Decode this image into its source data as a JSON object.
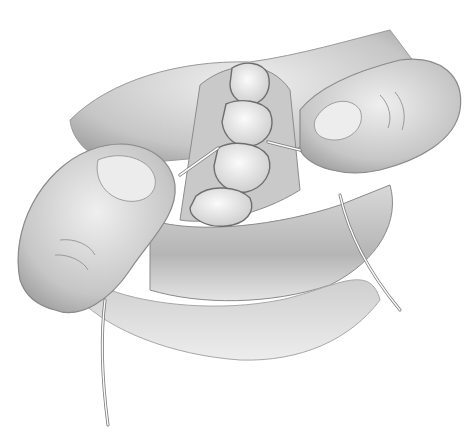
{
  "image": {
    "subject": "Illustration of fingers flossing between lower molars with lips retracted",
    "style": "grayscale pencil shading",
    "colors": {
      "background": "#ffffff",
      "skin_light": "#e6e6e6",
      "skin_mid": "#bdbdbd",
      "skin_dark": "#8a8a8a",
      "tooth": "#f2f2f2",
      "tooth_outline": "#6e6e6e",
      "floss": "#fafafa"
    }
  }
}
